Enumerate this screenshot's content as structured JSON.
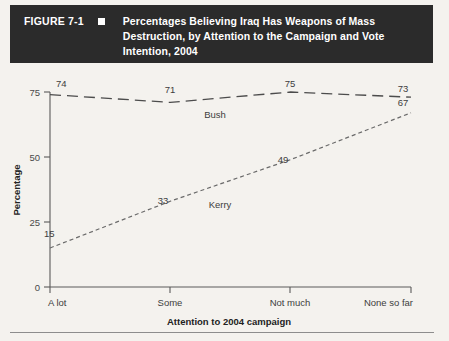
{
  "figure": {
    "number": "FIGURE 7-1",
    "bullet_icon": "square-marker",
    "title": "Percentages Believing Iraq Has Weapons of Mass Destruction, by Attention to the Campaign and Vote Intention, 2004"
  },
  "colors": {
    "header_background": "#2b2b2b",
    "header_text": "#ffffff",
    "page_background": "#f4f2ee",
    "axis": "#5a5a5a",
    "bush_line": "#4c4c4c",
    "kerry_line": "#6a6a6a"
  },
  "chart_data": {
    "type": "line",
    "title": "Percentages Believing Iraq Has Weapons of Mass Destruction, by Attention to the Campaign and Vote Intention, 2004",
    "xlabel": "Attention to 2004 campaign",
    "ylabel": "Percentage",
    "categories": [
      "A lot",
      "Some",
      "Not much",
      "None so far"
    ],
    "yticks": [
      0,
      25,
      50,
      75
    ],
    "ytick_labels": [
      "0",
      "25",
      "50",
      "75"
    ],
    "ylim": [
      0,
      80
    ],
    "grid": false,
    "legend": "inline-labels",
    "series": [
      {
        "name": "Bush",
        "values": [
          74,
          71,
          75,
          73
        ],
        "value_labels": [
          "74",
          "71",
          "75",
          "73"
        ],
        "linestyle": "long-dash"
      },
      {
        "name": "Kerry",
        "values": [
          15,
          33,
          49,
          67
        ],
        "value_labels": [
          "15",
          "33",
          "49",
          "67"
        ],
        "linestyle": "short-dash"
      }
    ]
  }
}
